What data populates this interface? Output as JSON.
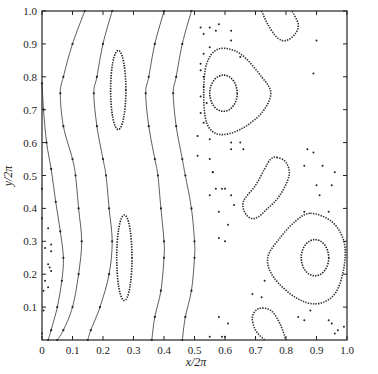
{
  "chart_data": {
    "type": "scatter",
    "subtype": "poincare-section",
    "title": "",
    "xlabel": "x/2π",
    "ylabel": "y/2π",
    "xlim": [
      0,
      1.0
    ],
    "ylim": [
      0,
      1.0
    ],
    "grid": false,
    "legend": null,
    "xticks": [
      "0",
      "0.1",
      "0.2",
      "0.3",
      "0.4",
      "0.5",
      "0.6",
      "0.7",
      "0.8",
      "0.9",
      "1.0"
    ],
    "yticks": [
      "0.1",
      "0.2",
      "0.3",
      "0.4",
      "0.5",
      "0.6",
      "0.7",
      "0.8",
      "0.9",
      "1.0"
    ],
    "curves": [
      {
        "name": "wavy-line-1",
        "kind": "open",
        "points": [
          [
            0.14,
            1.0
          ],
          [
            0.1,
            0.9
          ],
          [
            0.07,
            0.8
          ],
          [
            0.06,
            0.75
          ],
          [
            0.07,
            0.65
          ],
          [
            0.1,
            0.55
          ],
          [
            0.11,
            0.5
          ],
          [
            0.12,
            0.4
          ],
          [
            0.13,
            0.3
          ],
          [
            0.12,
            0.2
          ],
          [
            0.1,
            0.1
          ],
          [
            0.07,
            0.03
          ],
          [
            0.05,
            0.0
          ]
        ]
      },
      {
        "name": "wavy-line-2",
        "kind": "open",
        "points": [
          [
            0.23,
            1.0
          ],
          [
            0.2,
            0.9
          ],
          [
            0.18,
            0.8
          ],
          [
            0.17,
            0.75
          ],
          [
            0.18,
            0.65
          ],
          [
            0.2,
            0.55
          ],
          [
            0.21,
            0.5
          ],
          [
            0.22,
            0.4
          ],
          [
            0.23,
            0.3
          ],
          [
            0.22,
            0.2
          ],
          [
            0.19,
            0.1
          ],
          [
            0.16,
            0.03
          ],
          [
            0.15,
            0.0
          ]
        ]
      },
      {
        "name": "wavy-line-3",
        "kind": "open",
        "points": [
          [
            0.4,
            1.0
          ],
          [
            0.37,
            0.9
          ],
          [
            0.35,
            0.8
          ],
          [
            0.34,
            0.75
          ],
          [
            0.35,
            0.65
          ],
          [
            0.37,
            0.55
          ],
          [
            0.38,
            0.5
          ],
          [
            0.39,
            0.4
          ],
          [
            0.4,
            0.3
          ],
          [
            0.4,
            0.25
          ],
          [
            0.39,
            0.15
          ],
          [
            0.37,
            0.07
          ],
          [
            0.36,
            0.0
          ]
        ]
      },
      {
        "name": "wavy-line-4",
        "kind": "open",
        "points": [
          [
            0.49,
            1.0
          ],
          [
            0.46,
            0.9
          ],
          [
            0.44,
            0.8
          ],
          [
            0.43,
            0.75
          ],
          [
            0.44,
            0.65
          ],
          [
            0.46,
            0.55
          ],
          [
            0.47,
            0.5
          ],
          [
            0.49,
            0.4
          ],
          [
            0.5,
            0.3
          ],
          [
            0.5,
            0.25
          ],
          [
            0.49,
            0.15
          ],
          [
            0.47,
            0.07
          ],
          [
            0.46,
            0.0
          ]
        ]
      },
      {
        "name": "wavy-line-5",
        "kind": "open",
        "points": [
          [
            0.0,
            0.78
          ],
          [
            0.005,
            0.7
          ],
          [
            0.015,
            0.6
          ],
          [
            0.03,
            0.52
          ],
          [
            0.045,
            0.42
          ],
          [
            0.06,
            0.33
          ],
          [
            0.07,
            0.25
          ],
          [
            0.065,
            0.18
          ],
          [
            0.05,
            0.1
          ],
          [
            0.03,
            0.03
          ],
          [
            0.02,
            0.0
          ]
        ]
      },
      {
        "name": "island-upper-left",
        "kind": "closed",
        "cx": 0.25,
        "cy": 0.76,
        "rx": 0.025,
        "ry": 0.12
      },
      {
        "name": "island-lower-left",
        "kind": "closed",
        "cx": 0.27,
        "cy": 0.25,
        "rx": 0.025,
        "ry": 0.13
      },
      {
        "name": "island-upper-right-outer",
        "kind": "closed",
        "points": [
          [
            0.58,
            0.885
          ],
          [
            0.65,
            0.87
          ],
          [
            0.72,
            0.8
          ],
          [
            0.75,
            0.75
          ],
          [
            0.72,
            0.69
          ],
          [
            0.65,
            0.64
          ],
          [
            0.58,
            0.625
          ],
          [
            0.54,
            0.66
          ],
          [
            0.53,
            0.75
          ],
          [
            0.54,
            0.84
          ]
        ]
      },
      {
        "name": "island-upper-right-inner",
        "kind": "closed",
        "cx": 0.595,
        "cy": 0.75,
        "rx": 0.045,
        "ry": 0.055
      },
      {
        "name": "island-center-right",
        "kind": "closed",
        "points": [
          [
            0.77,
            0.555
          ],
          [
            0.8,
            0.54
          ],
          [
            0.81,
            0.5
          ],
          [
            0.78,
            0.44
          ],
          [
            0.74,
            0.4
          ],
          [
            0.7,
            0.37
          ],
          [
            0.67,
            0.38
          ],
          [
            0.66,
            0.42
          ],
          [
            0.7,
            0.47
          ],
          [
            0.73,
            0.52
          ],
          [
            0.75,
            0.55
          ]
        ]
      },
      {
        "name": "island-lower-right-outer",
        "kind": "closed",
        "points": [
          [
            0.88,
            0.385
          ],
          [
            0.95,
            0.36
          ],
          [
            0.99,
            0.3
          ],
          [
            0.99,
            0.22
          ],
          [
            0.96,
            0.14
          ],
          [
            0.9,
            0.11
          ],
          [
            0.83,
            0.13
          ],
          [
            0.76,
            0.19
          ],
          [
            0.74,
            0.25
          ],
          [
            0.78,
            0.31
          ],
          [
            0.83,
            0.36
          ]
        ]
      },
      {
        "name": "island-lower-right-inner",
        "kind": "closed",
        "cx": 0.895,
        "cy": 0.25,
        "rx": 0.045,
        "ry": 0.055
      },
      {
        "name": "arc-top-right",
        "kind": "open",
        "points": [
          [
            0.72,
            1.0
          ],
          [
            0.74,
            0.96
          ],
          [
            0.77,
            0.92
          ],
          [
            0.8,
            0.91
          ],
          [
            0.83,
            0.93
          ],
          [
            0.84,
            0.96
          ],
          [
            0.82,
            1.0
          ]
        ]
      },
      {
        "name": "arc-bottom-right",
        "kind": "open",
        "points": [
          [
            0.73,
            0.0
          ],
          [
            0.7,
            0.03
          ],
          [
            0.69,
            0.07
          ],
          [
            0.71,
            0.095
          ],
          [
            0.75,
            0.09
          ],
          [
            0.78,
            0.05
          ],
          [
            0.8,
            0.0
          ]
        ]
      }
    ],
    "scatter_points": [
      [
        0.52,
        0.95
      ],
      [
        0.55,
        0.95
      ],
      [
        0.53,
        0.93
      ],
      [
        0.57,
        0.94
      ],
      [
        0.55,
        0.89
      ],
      [
        0.58,
        0.96
      ],
      [
        0.62,
        0.94
      ],
      [
        0.62,
        0.91
      ],
      [
        0.65,
        0.86
      ],
      [
        0.53,
        0.87
      ],
      [
        0.52,
        0.84
      ],
      [
        0.52,
        0.82
      ],
      [
        0.53,
        0.8
      ],
      [
        0.53,
        0.77
      ],
      [
        0.52,
        0.74
      ],
      [
        0.54,
        0.72
      ],
      [
        0.52,
        0.69
      ],
      [
        0.53,
        0.66
      ],
      [
        0.51,
        0.62
      ],
      [
        0.55,
        0.61
      ],
      [
        0.62,
        0.6
      ],
      [
        0.65,
        0.6
      ],
      [
        0.62,
        0.58
      ],
      [
        0.66,
        0.58
      ],
      [
        0.51,
        0.56
      ],
      [
        0.55,
        0.55
      ],
      [
        0.56,
        0.51
      ],
      [
        0.57,
        0.46
      ],
      [
        0.55,
        0.44
      ],
      [
        0.59,
        0.46
      ],
      [
        0.6,
        0.46
      ],
      [
        0.62,
        0.44
      ],
      [
        0.63,
        0.41
      ],
      [
        0.58,
        0.39
      ],
      [
        0.58,
        0.31
      ],
      [
        0.61,
        0.35
      ],
      [
        0.6,
        0.3
      ],
      [
        0.56,
        0.51
      ],
      [
        0.9,
        0.91
      ],
      [
        0.89,
        0.81
      ],
      [
        0.87,
        0.58
      ],
      [
        0.89,
        0.57
      ],
      [
        0.86,
        0.53
      ],
      [
        0.92,
        0.53
      ],
      [
        0.96,
        0.51
      ],
      [
        0.95,
        0.47
      ],
      [
        0.9,
        0.47
      ],
      [
        0.91,
        0.44
      ],
      [
        0.94,
        0.39
      ],
      [
        0.86,
        0.39
      ],
      [
        0.72,
        0.13
      ],
      [
        0.69,
        0.14
      ],
      [
        0.73,
        0.18
      ],
      [
        0.84,
        0.07
      ],
      [
        0.86,
        0.06
      ],
      [
        0.88,
        0.09
      ],
      [
        0.94,
        0.06
      ],
      [
        0.95,
        0.05
      ],
      [
        0.97,
        0.03
      ],
      [
        0.99,
        0.04
      ],
      [
        0.96,
        0.02
      ],
      [
        0.59,
        0.01
      ],
      [
        0.6,
        0.01
      ],
      [
        0.61,
        0.05
      ],
      [
        0.55,
        0.01
      ],
      [
        0.58,
        0.07
      ],
      [
        0.02,
        0.34
      ],
      [
        0.03,
        0.29
      ],
      [
        0.01,
        0.28
      ],
      [
        0.03,
        0.27
      ],
      [
        0.02,
        0.23
      ],
      [
        0.025,
        0.22
      ],
      [
        0.03,
        0.21
      ],
      [
        0.01,
        0.18
      ],
      [
        0.02,
        0.16
      ],
      [
        0.005,
        0.15
      ],
      [
        0.005,
        0.09
      ],
      [
        0.0,
        0.02
      ],
      [
        0.0,
        0.37
      ],
      [
        0.0,
        0.46
      ]
    ]
  },
  "axes": {
    "x_label": "x/2π",
    "y_label": "y/2π"
  }
}
